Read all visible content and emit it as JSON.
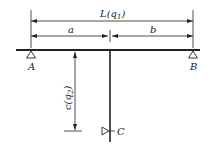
{
  "diagram": {
    "dimensions": {
      "total_length": {
        "label": "L",
        "arg": "q",
        "sub": "1"
      },
      "segment_a": {
        "label": "a"
      },
      "segment_b": {
        "label": "b"
      },
      "offset_c": {
        "label": "c",
        "arg": "q",
        "sub": "2"
      }
    },
    "supports": {
      "A": {
        "label": "A"
      },
      "B": {
        "label": "B"
      },
      "C": {
        "label": "C"
      }
    },
    "colors": {
      "line": "#222222",
      "background": "#ffffff"
    }
  }
}
